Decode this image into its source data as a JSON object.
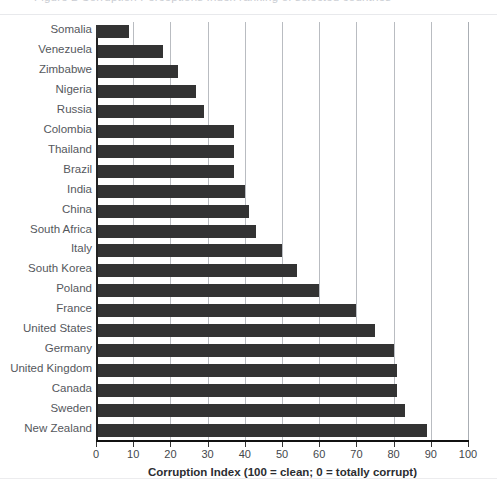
{
  "clipped_header": {
    "ghost_text": "Figure 2  Corruption Perceptions Index ranking of selected countries"
  },
  "chart_data": {
    "type": "bar",
    "orientation": "horizontal",
    "title": "",
    "xlabel": "Corruption Index (100 = clean; 0 = totally corrupt)",
    "ylabel": "",
    "xlim": [
      0,
      100
    ],
    "xticks": [
      0,
      10,
      20,
      30,
      40,
      50,
      60,
      70,
      80,
      90,
      100
    ],
    "xticklabels": [
      "0",
      "10",
      "20",
      "30",
      "40",
      "50",
      "60",
      "70",
      "80",
      "90",
      "100"
    ],
    "grid": "vertical",
    "legend": "none",
    "bar_color": "#333333",
    "gridline_color": "#b9bcc1",
    "categories": [
      "Somalia",
      "Venezuela",
      "Zimbabwe",
      "Nigeria",
      "Russia",
      "Colombia",
      "Thailand",
      "Brazil",
      "India",
      "China",
      "South Africa",
      "Italy",
      "South Korea",
      "Poland",
      "France",
      "United States",
      "Germany",
      "United Kingdom",
      "Canada",
      "Sweden",
      "New Zealand"
    ],
    "values": [
      9,
      18,
      22,
      27,
      29,
      37,
      37,
      37,
      40,
      41,
      43,
      50,
      54,
      60,
      70,
      75,
      80,
      81,
      81,
      83,
      89
    ]
  }
}
